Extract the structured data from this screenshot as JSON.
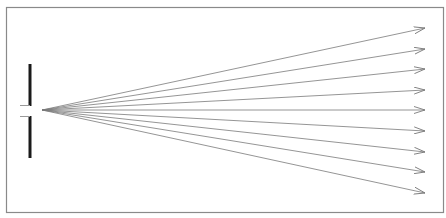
{
  "diagram": {
    "type": "single-slit-diffraction",
    "frame": {
      "x": 6.5,
      "y": 7.5,
      "w": 437,
      "h": 205,
      "stroke": "#8a8a8a"
    },
    "barrier": {
      "x": 30,
      "top_segment": {
        "y1": 64,
        "y2": 106
      },
      "bottom_segment": {
        "y1": 116,
        "y2": 158
      },
      "color": "#1a1a1a",
      "width": 3
    },
    "slit_edges": [
      {
        "x1": 20,
        "y1": 105.5,
        "x2": 30,
        "y2": 105.5
      },
      {
        "x1": 20,
        "y1": 116.5,
        "x2": 30,
        "y2": 116.5
      }
    ],
    "source": {
      "x": 42,
      "y": 110
    },
    "rays": {
      "color": "#7a7a7a",
      "tip_x": 425,
      "tip_y": [
        28,
        49,
        69,
        90,
        110,
        131,
        152,
        172,
        193
      ]
    }
  }
}
